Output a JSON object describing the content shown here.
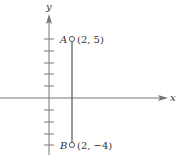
{
  "diagram": {
    "axes": {
      "x_label": "x",
      "y_label": "y"
    },
    "points": [
      {
        "name": "A",
        "coords_label": "(2, 5)",
        "x": 2,
        "y": 5
      },
      {
        "name": "B",
        "coords_label": "(2, −4)",
        "x": 2,
        "y": -4
      }
    ],
    "segment": {
      "from": "A",
      "to": "B"
    },
    "colors": {
      "axis": "#666666",
      "line": "#555555",
      "text": "#333333"
    }
  }
}
